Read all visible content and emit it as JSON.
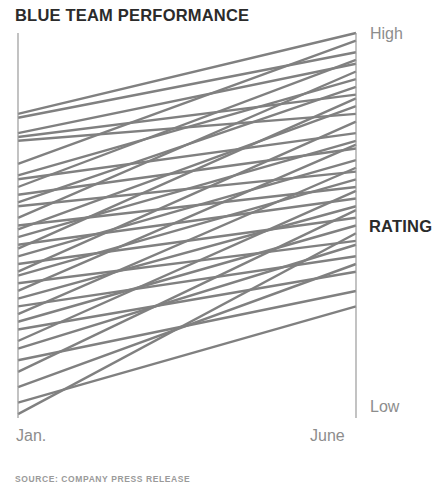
{
  "chart_data": {
    "type": "line",
    "subtype": "slopegraph",
    "title": "BLUE TEAM PERFORMANCE",
    "xlabel": "",
    "ylabel": "RATING",
    "categories": [
      "Jan.",
      "June"
    ],
    "x": [
      0,
      1
    ],
    "ylim": [
      0,
      100
    ],
    "y_axis_top_label": "High",
    "y_axis_bottom_label": "Low",
    "grid": false,
    "legend": false,
    "legend_position": "none",
    "series_color": "#808080",
    "axis_color": "#9a9a9a",
    "note": "Each line is one team member's rating moving from January to June; nearly all slopes rise.",
    "series": [
      {
        "name": "member-01",
        "values": [
          79,
          100
        ]
      },
      {
        "name": "member-02",
        "values": [
          78,
          95
        ]
      },
      {
        "name": "member-03",
        "values": [
          74,
          92
        ]
      },
      {
        "name": "member-04",
        "values": [
          73,
          84
        ]
      },
      {
        "name": "member-05",
        "values": [
          72,
          79
        ]
      },
      {
        "name": "member-06",
        "values": [
          66,
          98
        ]
      },
      {
        "name": "member-07",
        "values": [
          63,
          88
        ]
      },
      {
        "name": "member-08",
        "values": [
          62,
          74
        ]
      },
      {
        "name": "member-09",
        "values": [
          60,
          93
        ]
      },
      {
        "name": "member-10",
        "values": [
          58,
          70
        ]
      },
      {
        "name": "member-11",
        "values": [
          56,
          86
        ]
      },
      {
        "name": "member-12",
        "values": [
          55,
          64
        ]
      },
      {
        "name": "member-13",
        "values": [
          52,
          90
        ]
      },
      {
        "name": "member-14",
        "values": [
          50,
          60
        ]
      },
      {
        "name": "member-15",
        "values": [
          49,
          81
        ]
      },
      {
        "name": "member-16",
        "values": [
          47,
          72
        ]
      },
      {
        "name": "member-17",
        "values": [
          45,
          57
        ]
      },
      {
        "name": "member-18",
        "values": [
          44,
          83
        ]
      },
      {
        "name": "member-19",
        "values": [
          42,
          67
        ]
      },
      {
        "name": "member-20",
        "values": [
          40,
          52
        ]
      },
      {
        "name": "member-21",
        "values": [
          38,
          77
        ]
      },
      {
        "name": "member-22",
        "values": [
          37,
          62
        ]
      },
      {
        "name": "member-23",
        "values": [
          35,
          46
        ]
      },
      {
        "name": "member-24",
        "values": [
          33,
          71
        ]
      },
      {
        "name": "member-25",
        "values": [
          31,
          55
        ]
      },
      {
        "name": "member-26",
        "values": [
          29,
          42
        ]
      },
      {
        "name": "member-27",
        "values": [
          27,
          65
        ]
      },
      {
        "name": "member-28",
        "values": [
          25,
          50
        ]
      },
      {
        "name": "member-29",
        "values": [
          23,
          38
        ]
      },
      {
        "name": "member-30",
        "values": [
          20,
          59
        ]
      },
      {
        "name": "member-31",
        "values": [
          18,
          45
        ]
      },
      {
        "name": "member-32",
        "values": [
          15,
          33
        ]
      },
      {
        "name": "member-33",
        "values": [
          12,
          54
        ]
      },
      {
        "name": "member-34",
        "values": [
          8,
          40
        ]
      },
      {
        "name": "member-35",
        "values": [
          4,
          29
        ]
      },
      {
        "name": "member-36",
        "values": [
          1,
          48
        ]
      }
    ]
  },
  "labels": {
    "title": "BLUE TEAM PERFORMANCE",
    "high": "High",
    "low": "Low",
    "rating": "RATING",
    "jan": "Jan.",
    "june": "June",
    "source": "SOURCE: COMPANY PRESS RELEASE"
  },
  "geometry": {
    "left_axis_x": 18,
    "right_axis_x": 356,
    "axis_top_y": 33,
    "axis_bottom_y": 418,
    "line_width": 2.4
  }
}
